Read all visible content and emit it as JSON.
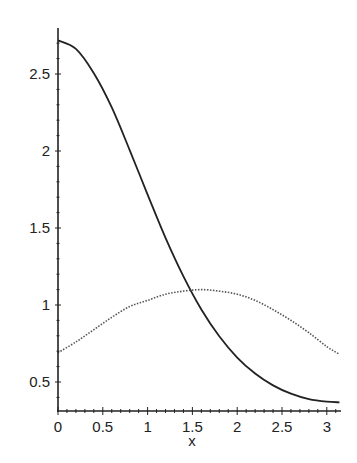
{
  "chart_data": {
    "type": "line",
    "title": "",
    "xlabel": "x",
    "ylabel": "",
    "xlim": [
      0,
      3.1416
    ],
    "ylim": [
      0.305,
      2.75
    ],
    "x_ticks": [
      "0",
      "0.5",
      "1",
      "1.5",
      "2",
      "2.5",
      "3"
    ],
    "x_tick_values": [
      0,
      0.5,
      1,
      1.5,
      2,
      2.5,
      3
    ],
    "y_ticks": [
      "0.5",
      "1",
      "1.5",
      "2",
      "2.5"
    ],
    "y_tick_values": [
      0.5,
      1,
      1.5,
      2,
      2.5
    ],
    "grid": false,
    "legend": null,
    "x": [
      0,
      0.2,
      0.4,
      0.6,
      0.8,
      1.0,
      1.2,
      1.4,
      1.6,
      1.8,
      2.0,
      2.2,
      2.4,
      2.6,
      2.8,
      3.0,
      3.1416
    ],
    "series": [
      {
        "name": "solid",
        "style": "solid",
        "color": "#222222",
        "values": [
          2.718,
          2.663,
          2.505,
          2.283,
          2.006,
          1.717,
          1.436,
          1.186,
          0.971,
          0.797,
          0.659,
          0.555,
          0.478,
          0.424,
          0.389,
          0.372,
          0.368
        ]
      },
      {
        "name": "dotted",
        "style": "dotted",
        "color": "#555555",
        "values": [
          0.69,
          0.76,
          0.84,
          0.92,
          0.99,
          1.03,
          1.07,
          1.09,
          1.1,
          1.09,
          1.07,
          1.03,
          0.97,
          0.9,
          0.82,
          0.73,
          0.68
        ]
      }
    ]
  }
}
